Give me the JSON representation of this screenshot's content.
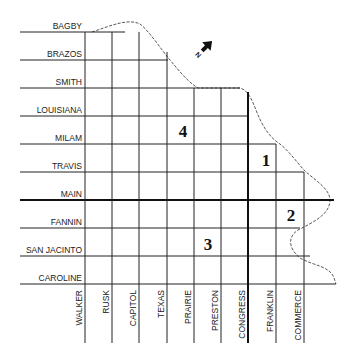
{
  "map": {
    "horizontal_streets": [
      {
        "name": "BAGBY",
        "y": 32
      },
      {
        "name": "BRAZOS",
        "y": 60
      },
      {
        "name": "SMITH",
        "y": 88
      },
      {
        "name": "LOUISIANA",
        "y": 116
      },
      {
        "name": "MILAM",
        "y": 144
      },
      {
        "name": "TRAVIS",
        "y": 172
      },
      {
        "name": "MAIN",
        "y": 200,
        "major": true
      },
      {
        "name": "FANNIN",
        "y": 228
      },
      {
        "name": "SAN JACINTO",
        "y": 256
      },
      {
        "name": "CAROLINE",
        "y": 284
      }
    ],
    "vertical_streets": [
      {
        "name": "WALKER",
        "x": 85
      },
      {
        "name": "RUSK",
        "x": 112
      },
      {
        "name": "CAPITOL",
        "x": 139
      },
      {
        "name": "TEXAS",
        "x": 167
      },
      {
        "name": "PRAIRIE",
        "x": 194
      },
      {
        "name": "PRESTON",
        "x": 221
      },
      {
        "name": "CONGRESS",
        "x": 248,
        "major": true
      },
      {
        "name": "FRANKLIN",
        "x": 276
      },
      {
        "name": "COMMERCE",
        "x": 304
      }
    ],
    "zones": [
      {
        "label": "1",
        "x": 266,
        "y": 166
      },
      {
        "label": "2",
        "x": 291,
        "y": 221
      },
      {
        "label": "3",
        "x": 208,
        "y": 250
      },
      {
        "label": "4",
        "x": 183,
        "y": 137
      }
    ],
    "north_arrow": {
      "label": "N"
    }
  }
}
